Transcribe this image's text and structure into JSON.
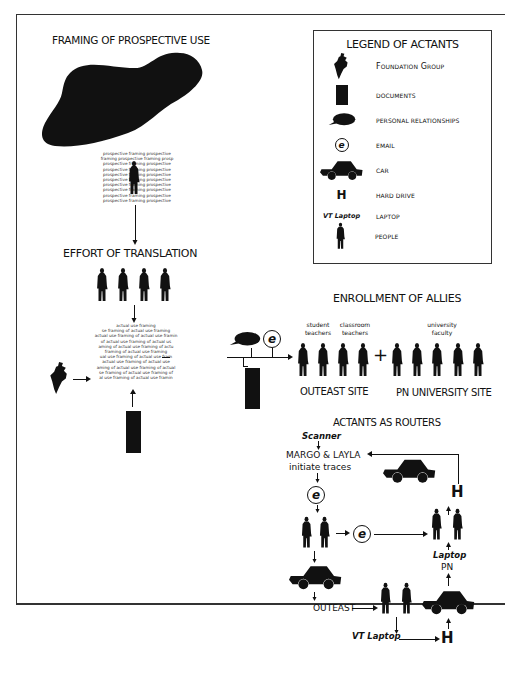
{
  "figure": {
    "sections": {
      "framing": {
        "title": "FRAMING OF PROSPECTIVE USE",
        "text_lines": [
          "prospective framing prospective",
          "framing prospective framing prosp",
          "prospective framing prospective",
          "prospective framing prospective",
          "prospective framing prospective",
          "prospective framing prospective",
          "prospective framing prospective",
          "prospective framing prospective",
          "prospective framing prospective",
          "prospective framing prospective"
        ]
      },
      "translation": {
        "title": "EFFORT OF TRANSLATION",
        "text_lines": [
          "actual use framing",
          "se framing of actual use framing",
          "actual use framing of actual use framin",
          "of actual use framing of actual us",
          "aming of actual use framing of actu",
          "framing of actual use framing",
          "ual use framing of actual use fram",
          "actual use framing of actual use",
          "aming of actual use framing of actual",
          "se framing of actual use framing of",
          "al use framing of actual use framin"
        ]
      },
      "enrollment": {
        "title": "ENROLLMENT OF ALLIES",
        "groups": [
          {
            "label": "student\nteachers",
            "label_line1": "student",
            "label_line2": "teachers"
          },
          {
            "label": "classroom\nteachers",
            "label_line1": "classroom",
            "label_line2": "teachers"
          },
          {
            "label": "university\nfaculty",
            "label_line1": "university",
            "label_line2": "faculty"
          }
        ],
        "plus_sign": "+",
        "sites": [
          "OUTEAST SITE",
          "PN UNIVERSITY SITE"
        ]
      },
      "routers": {
        "title": "ACTANTS AS ROUTERS",
        "scanner": "Scanner",
        "initiators_line1": "MARGO & LAYLA",
        "initiators_line2": "initiate traces",
        "email_glyph": "e",
        "laptop_label": "Laptop",
        "pn_label": "PN",
        "outeast_label": "OUTEAST",
        "vt_laptop_label": "VT Laptop",
        "hard_drive_glyph": "H"
      }
    },
    "legend": {
      "title": "LEGEND OF ACTANTS",
      "items": [
        {
          "icon": "foundation-group-icon",
          "label": "Foundation Group"
        },
        {
          "icon": "document-icon",
          "label": "DOCUMENTS"
        },
        {
          "icon": "speech-bubble-icon",
          "label": "PERSONAL RELATIONSHIPS"
        },
        {
          "icon": "email-icon",
          "glyph": "e",
          "label": "EMAIL"
        },
        {
          "icon": "car-icon",
          "label": "CAR"
        },
        {
          "icon": "hard-drive-icon",
          "glyph": "H",
          "label": "HARD DRIVE"
        },
        {
          "icon": "laptop-icon",
          "glyph": "VT Laptop",
          "label": "LAPTOP"
        },
        {
          "icon": "person-icon",
          "label": "PEOPLE"
        }
      ]
    },
    "colors": {
      "ink": "#111111",
      "paper": "#ffffff",
      "frame": "#333333"
    }
  }
}
